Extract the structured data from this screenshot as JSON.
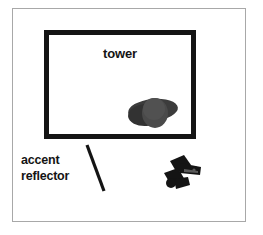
{
  "scene": {
    "background_color": "#ffffff",
    "frame_color": "#a8a8a8",
    "ink_color": "#141414"
  },
  "tower_box": {
    "label": "tower",
    "border_color": "#141414",
    "fill_color": "#ffffff"
  },
  "objects": {
    "blob": {
      "name": "dark-rounded-object",
      "color": "#3a3a3a",
      "highlight_color": "#4f4f4f"
    },
    "clamp": {
      "name": "dark-clamp-object",
      "color": "#151515"
    }
  },
  "annotation": {
    "line1": "accent",
    "line2": "reflector",
    "leader_color": "#141414"
  }
}
